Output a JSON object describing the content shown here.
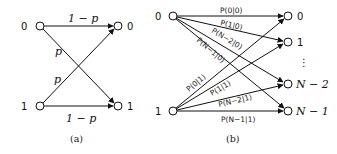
{
  "figure_a": {
    "caption": "(a)",
    "inputs": [
      "0",
      "1"
    ],
    "outputs": [
      "0",
      "1"
    ],
    "edges": [
      {
        "from": "0",
        "to": "0",
        "label": "1 − p"
      },
      {
        "from": "0",
        "to": "1",
        "label": "p"
      },
      {
        "from": "1",
        "to": "0",
        "label": "p"
      },
      {
        "from": "1",
        "to": "1",
        "label": "1 − p"
      }
    ]
  },
  "figure_b": {
    "caption": "(b)",
    "inputs": [
      "0",
      "1"
    ],
    "outputs": [
      "0",
      "1",
      "⋮",
      "N − 2",
      "N − 1"
    ],
    "edges_from_0": [
      {
        "to": "0",
        "label": "P(0|0)"
      },
      {
        "to": "1",
        "label": "P(1|0)"
      },
      {
        "to": "N − 2",
        "label": "P(N−2|0)"
      },
      {
        "to": "N − 1",
        "label": "P(N−1|0)"
      }
    ],
    "edges_from_1": [
      {
        "to": "0",
        "label": "P(0|1)"
      },
      {
        "to": "1",
        "label": "P(1|1)"
      },
      {
        "to": "N − 2",
        "label": "P(N−2|1)"
      },
      {
        "to": "N − 1",
        "label": "P(N−1|1)"
      }
    ]
  }
}
